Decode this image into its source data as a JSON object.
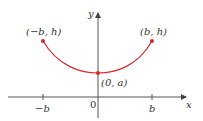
{
  "diagram": {
    "type": "catenary-curve-on-axes",
    "axes": {
      "x_label": "x",
      "y_label": "y",
      "origin_label": "0",
      "x_ticks": [
        "−b",
        "b"
      ],
      "axis_color": "#555555"
    },
    "curve": {
      "color": "#d9262b",
      "shape": "U-shaped curve symmetric about the y-axis"
    },
    "points": [
      {
        "label": "(−b, h)",
        "role": "left-endpoint"
      },
      {
        "label": "(b, h)",
        "role": "right-endpoint"
      },
      {
        "label": "(0, a)",
        "role": "vertex"
      }
    ]
  }
}
